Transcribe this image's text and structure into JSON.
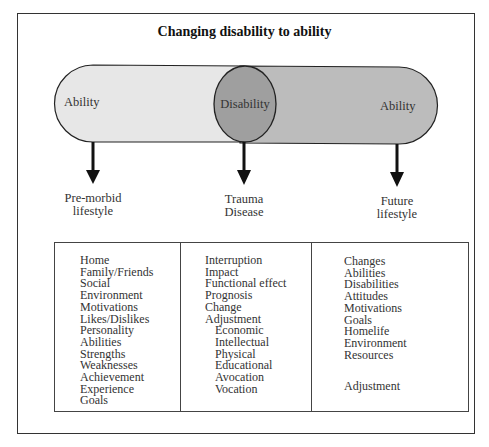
{
  "title": "Changing disability to ability",
  "shapes": {
    "left_pill_label": "Ability",
    "circle_label": "Disability",
    "right_pill_label": "Ability",
    "colors": {
      "left_pill": "#e6e6e6",
      "right_pill": "#bdbdbd",
      "circle": "#9e9e9e",
      "outline": "#222222"
    }
  },
  "arrows": [
    {
      "label_line1": "Pre-morbid",
      "label_line2": "lifestyle"
    },
    {
      "label_line1": "Trauma",
      "label_line2": "Disease"
    },
    {
      "label_line1": "Future",
      "label_line2": "lifestyle"
    }
  ],
  "columns": [
    {
      "items": [
        {
          "text": "Home",
          "indent": false
        },
        {
          "text": "Family/Friends",
          "indent": false
        },
        {
          "text": "Social",
          "indent": false
        },
        {
          "text": "Environment",
          "indent": false
        },
        {
          "text": "Motivations",
          "indent": false
        },
        {
          "text": "Likes/Dislikes",
          "indent": false
        },
        {
          "text": "Personality",
          "indent": false
        },
        {
          "text": "Abilities",
          "indent": false
        },
        {
          "text": "Strengths",
          "indent": false
        },
        {
          "text": "Weaknesses",
          "indent": false
        },
        {
          "text": "Achievement",
          "indent": false
        },
        {
          "text": "Experience",
          "indent": false
        },
        {
          "text": "Goals",
          "indent": false
        }
      ]
    },
    {
      "items": [
        {
          "text": "Interruption",
          "indent": false
        },
        {
          "text": "Impact",
          "indent": false
        },
        {
          "text": "Functional effect",
          "indent": false
        },
        {
          "text": "Prognosis",
          "indent": false
        },
        {
          "text": "Change",
          "indent": false
        },
        {
          "text": "Adjustment",
          "indent": false
        },
        {
          "text": "Economic",
          "indent": true
        },
        {
          "text": "Intellectual",
          "indent": true
        },
        {
          "text": "Physical",
          "indent": true
        },
        {
          "text": "Educational",
          "indent": true
        },
        {
          "text": "Avocation",
          "indent": true
        },
        {
          "text": "Vocation",
          "indent": true
        }
      ]
    },
    {
      "items": [
        {
          "text": "Changes",
          "indent": false
        },
        {
          "text": "Abilities",
          "indent": false
        },
        {
          "text": "Disabilities",
          "indent": false
        },
        {
          "text": "Attitudes",
          "indent": false
        },
        {
          "text": "Motivations",
          "indent": false
        },
        {
          "text": "Goals",
          "indent": false
        },
        {
          "text": "Homelife",
          "indent": false
        },
        {
          "text": "Environment",
          "indent": false
        },
        {
          "text": "Resources",
          "indent": false
        }
      ],
      "footer": "Adjustment"
    }
  ]
}
